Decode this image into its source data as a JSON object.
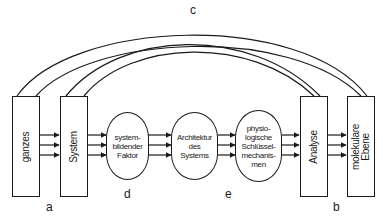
{
  "diagram": {
    "boxes": [
      {
        "id": "ganzes",
        "label": "ganzes"
      },
      {
        "id": "system",
        "label": "System"
      },
      {
        "id": "analyse",
        "label": "Analyse"
      },
      {
        "id": "molekulare",
        "label": "molekulare\nEbene"
      }
    ],
    "ovals": [
      {
        "id": "systembildender",
        "label": "system-\nbildender\nFaktor"
      },
      {
        "id": "architektur",
        "label": "Architektur\ndes\nSystems"
      },
      {
        "id": "physiologische",
        "label": "physio-\nlogische\nSchlüssel-\nmechanis-\nmen"
      }
    ],
    "letters": {
      "a": "a",
      "b": "b",
      "c": "c",
      "d": "d",
      "e": "e"
    },
    "colors": {
      "line": "#1a1a1a",
      "background": "#ffffff"
    }
  }
}
